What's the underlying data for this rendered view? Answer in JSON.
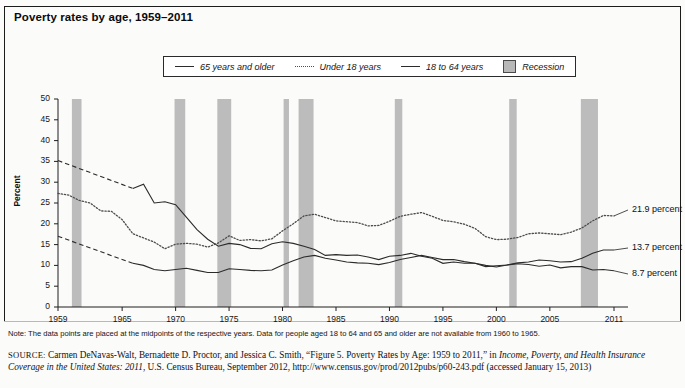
{
  "title": "Poverty rates by age, 1959–2011",
  "legend": {
    "items": [
      {
        "label": "65 years and older",
        "style": "solid",
        "swatch": "line-solid-icon"
      },
      {
        "label": "Under 18 years",
        "style": "dotted",
        "swatch": "line-dotted-icon"
      },
      {
        "label": "18 to 64 years",
        "style": "solid",
        "swatch": "line-solid-icon"
      },
      {
        "label": "Recession",
        "style": "box",
        "swatch": "recession-box-icon"
      }
    ]
  },
  "notes": {
    "note": "Note: The data points are placed at the midpoints of the respective years. Data for people aged 18 to 64 and 65 and older are not available from 1960 to 1965.",
    "source_prefix": "SOURCE:",
    "source_part1": " Carmen DeNavas-Walt, Bernadette D. Proctor, and Jessica C. Smith, “Figure 5. Poverty Rates by Age: 1959 to 2011,” in ",
    "source_italic1": "Income, Poverty, and Health Insurance Coverage in the United States: 2011",
    "source_part2": ", U.S. Census Bureau, September 2012, http://www.census.gov/prod/2012pubs/p60-243.pdf (accessed January 15, 2013)"
  },
  "chart_data": {
    "type": "line",
    "title": "Poverty rates by age, 1959–2011",
    "xlabel": "",
    "ylabel": "Percent",
    "xlim": [
      1959,
      2011
    ],
    "ylim": [
      0,
      50
    ],
    "ytick_labels": [
      "0",
      "5",
      "10",
      "15",
      "20",
      "25",
      "30",
      "35",
      "40",
      "45",
      "50"
    ],
    "yticks": [
      0,
      5,
      10,
      15,
      20,
      25,
      30,
      35,
      40,
      45,
      50
    ],
    "xtick_labels": [
      "1959",
      "1965",
      "1970",
      "1975",
      "1980",
      "1985",
      "1990",
      "1995",
      "2000",
      "2005",
      "2011"
    ],
    "xticks": [
      1959,
      1965,
      1970,
      1975,
      1980,
      1985,
      1990,
      1995,
      2000,
      2005,
      2011
    ],
    "grid": false,
    "legend_position": "top-center",
    "colors": {
      "line": "#2b2b2b",
      "dotted": "#4d4d4d",
      "recession": "#bcbcbc"
    },
    "end_labels": [
      {
        "series": "Under 18 years",
        "text": "21.9 percent",
        "value": 21.9
      },
      {
        "series": "18 to 64 years",
        "text": "13.7 percent",
        "value": 13.7
      },
      {
        "series": "65 years and older",
        "text": "8.7 percent",
        "value": 8.7
      }
    ],
    "recessions": [
      {
        "start": 1960.3,
        "end": 1961.2
      },
      {
        "start": 1969.9,
        "end": 1970.9
      },
      {
        "start": 1973.9,
        "end": 1975.2
      },
      {
        "start": 1980.1,
        "end": 1980.6
      },
      {
        "start": 1981.5,
        "end": 1982.9
      },
      {
        "start": 1990.5,
        "end": 1991.2
      },
      {
        "start": 2001.2,
        "end": 2001.9
      },
      {
        "start": 2007.9,
        "end": 2009.5
      }
    ],
    "series": [
      {
        "name": "65 years and older",
        "style": "solid",
        "dashed_segment": [
          1959,
          1966
        ],
        "x": [
          1959,
          1966,
          1967,
          1968,
          1969,
          1970,
          1971,
          1972,
          1973,
          1974,
          1975,
          1976,
          1977,
          1978,
          1979,
          1980,
          1981,
          1982,
          1983,
          1984,
          1985,
          1986,
          1987,
          1988,
          1989,
          1990,
          1991,
          1992,
          1993,
          1994,
          1995,
          1996,
          1997,
          1998,
          1999,
          2000,
          2001,
          2002,
          2003,
          2004,
          2005,
          2006,
          2007,
          2008,
          2009,
          2010,
          2011
        ],
        "y": [
          35.2,
          28.5,
          29.5,
          25.0,
          25.3,
          24.6,
          21.6,
          18.6,
          16.3,
          14.6,
          15.3,
          15.0,
          14.1,
          14.0,
          15.2,
          15.7,
          15.3,
          14.6,
          13.8,
          12.4,
          12.6,
          12.4,
          12.5,
          12.0,
          11.4,
          12.2,
          12.4,
          12.9,
          12.2,
          11.7,
          10.5,
          10.8,
          10.5,
          10.5,
          9.7,
          9.9,
          10.1,
          10.4,
          10.2,
          9.8,
          10.1,
          9.4,
          9.7,
          9.7,
          8.9,
          9.0,
          8.7
        ]
      },
      {
        "name": "Under 18 years",
        "style": "dotted",
        "x": [
          1959,
          1960,
          1961,
          1962,
          1963,
          1964,
          1965,
          1966,
          1967,
          1968,
          1969,
          1970,
          1971,
          1972,
          1973,
          1974,
          1975,
          1976,
          1977,
          1978,
          1979,
          1980,
          1981,
          1982,
          1983,
          1984,
          1985,
          1986,
          1987,
          1988,
          1989,
          1990,
          1991,
          1992,
          1993,
          1994,
          1995,
          1996,
          1997,
          1998,
          1999,
          2000,
          2001,
          2002,
          2003,
          2004,
          2005,
          2006,
          2007,
          2008,
          2009,
          2010,
          2011
        ],
        "y": [
          27.3,
          26.9,
          25.6,
          25.0,
          23.1,
          23.0,
          21.0,
          17.6,
          16.6,
          15.6,
          14.0,
          15.1,
          15.3,
          15.1,
          14.4,
          15.4,
          17.1,
          16.0,
          16.2,
          15.9,
          16.4,
          18.3,
          20.0,
          21.9,
          22.3,
          21.5,
          20.7,
          20.5,
          20.3,
          19.5,
          19.6,
          20.6,
          21.8,
          22.3,
          22.7,
          21.8,
          20.8,
          20.5,
          19.9,
          18.9,
          16.9,
          16.2,
          16.3,
          16.7,
          17.6,
          17.8,
          17.6,
          17.4,
          18.0,
          19.0,
          20.7,
          22.0,
          21.9
        ]
      },
      {
        "name": "18 to 64 years",
        "style": "solid",
        "dashed_segment": [
          1959,
          1966
        ],
        "x": [
          1959,
          1966,
          1967,
          1968,
          1969,
          1970,
          1971,
          1972,
          1973,
          1974,
          1975,
          1976,
          1977,
          1978,
          1979,
          1980,
          1981,
          1982,
          1983,
          1984,
          1985,
          1986,
          1987,
          1988,
          1989,
          1990,
          1991,
          1992,
          1993,
          1994,
          1995,
          1996,
          1997,
          1998,
          1999,
          2000,
          2001,
          2002,
          2003,
          2004,
          2005,
          2006,
          2007,
          2008,
          2009,
          2010,
          2011
        ],
        "y": [
          17.0,
          10.5,
          10.0,
          9.0,
          8.7,
          9.0,
          9.3,
          8.8,
          8.3,
          8.3,
          9.2,
          9.0,
          8.8,
          8.7,
          8.9,
          10.1,
          11.1,
          12.0,
          12.4,
          11.7,
          11.3,
          10.8,
          10.6,
          10.5,
          10.2,
          10.7,
          11.4,
          11.9,
          12.4,
          11.9,
          11.4,
          11.4,
          10.9,
          10.5,
          10.0,
          9.6,
          10.1,
          10.6,
          10.8,
          11.3,
          11.1,
          10.8,
          10.9,
          11.7,
          12.9,
          13.7,
          13.7
        ]
      }
    ]
  }
}
